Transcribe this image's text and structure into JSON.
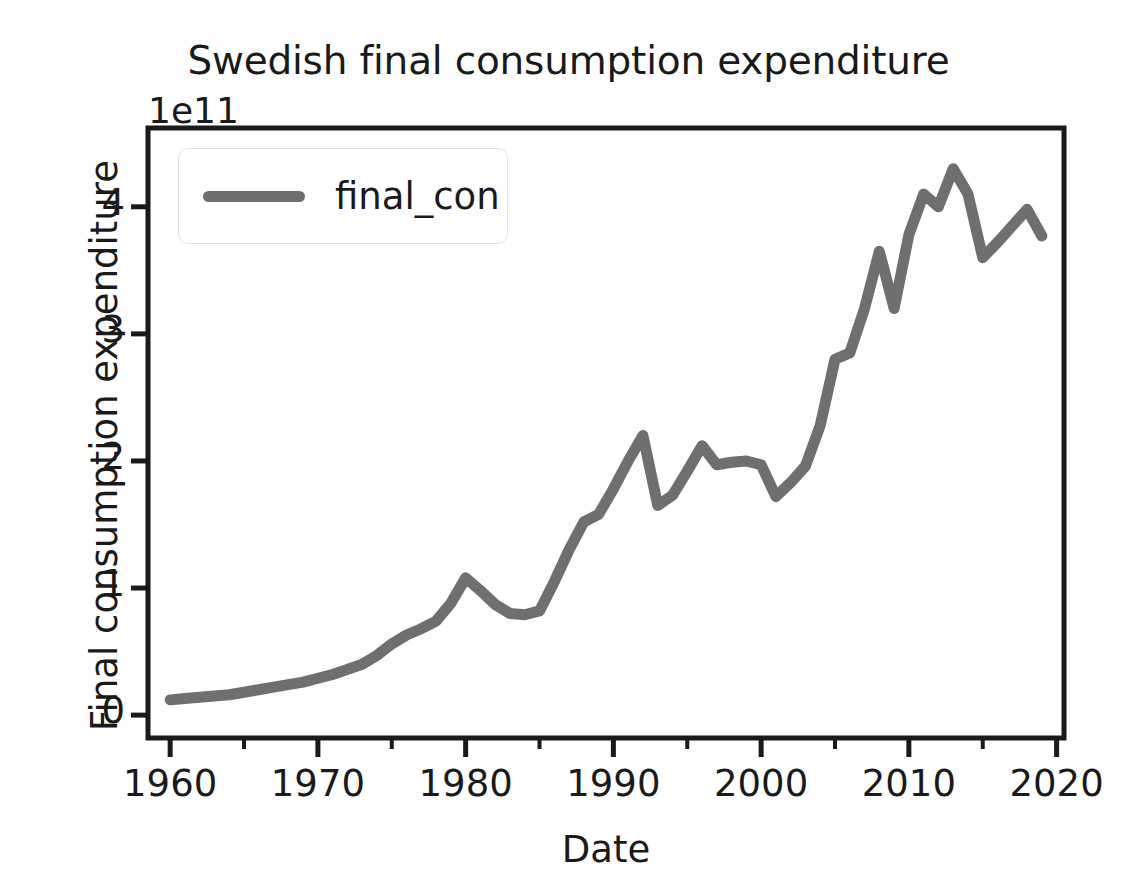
{
  "chart_data": {
    "type": "line",
    "title": "Swedish final consumption expenditure",
    "xlabel": "Date",
    "ylabel": "Final consumption expenditure",
    "y_offset_text": "1e11",
    "y_offset_multiplier": 100000000000.0,
    "grid": false,
    "legend_position": "upper left",
    "xlim": [
      1958.5,
      2020.5
    ],
    "ylim": [
      -0.18,
      4.62
    ],
    "xticks": [
      1960,
      1970,
      1980,
      1990,
      2000,
      2010,
      2020
    ],
    "xtick_labels": [
      "1960",
      "1970",
      "1980",
      "1990",
      "2000",
      "2010",
      "2020"
    ],
    "xminor_ticks": [
      1965,
      1975,
      1985,
      1995,
      2005,
      2015
    ],
    "yticks": [
      0,
      1,
      2,
      3,
      4
    ],
    "ytick_labels": [
      "0",
      "1",
      "2",
      "3",
      "4"
    ],
    "line_color": "#6f6f6f",
    "line_width": 11,
    "series": [
      {
        "name": "final_con",
        "x": [
          1960,
          1961,
          1962,
          1963,
          1964,
          1965,
          1966,
          1967,
          1968,
          1969,
          1970,
          1971,
          1972,
          1973,
          1974,
          1975,
          1976,
          1977,
          1978,
          1979,
          1980,
          1981,
          1982,
          1983,
          1984,
          1985,
          1986,
          1987,
          1988,
          1989,
          1990,
          1991,
          1992,
          1993,
          1994,
          1995,
          1996,
          1997,
          1998,
          1999,
          2000,
          2001,
          2002,
          2003,
          2004,
          2005,
          2006,
          2007,
          2008,
          2009,
          2010,
          2011,
          2012,
          2013,
          2014,
          2015,
          2016,
          2017,
          2018,
          2019
        ],
        "values": [
          0.12,
          0.13,
          0.14,
          0.15,
          0.16,
          0.18,
          0.2,
          0.22,
          0.24,
          0.26,
          0.29,
          0.32,
          0.36,
          0.4,
          0.47,
          0.56,
          0.63,
          0.68,
          0.74,
          0.88,
          1.08,
          0.98,
          0.87,
          0.8,
          0.79,
          0.82,
          1.05,
          1.3,
          1.52,
          1.58,
          1.78,
          2.0,
          2.2,
          1.65,
          1.73,
          1.92,
          2.12,
          1.97,
          1.99,
          2.0,
          1.97,
          1.72,
          1.83,
          1.96,
          2.28,
          2.8,
          2.85,
          3.2,
          3.65,
          3.2,
          3.78,
          4.1,
          4.0,
          4.3,
          4.1,
          3.6,
          3.72,
          3.85,
          3.98,
          3.77
        ]
      }
    ]
  },
  "figure": {
    "background_color": "#ffffff",
    "axes_color": "#1a1a1a"
  }
}
